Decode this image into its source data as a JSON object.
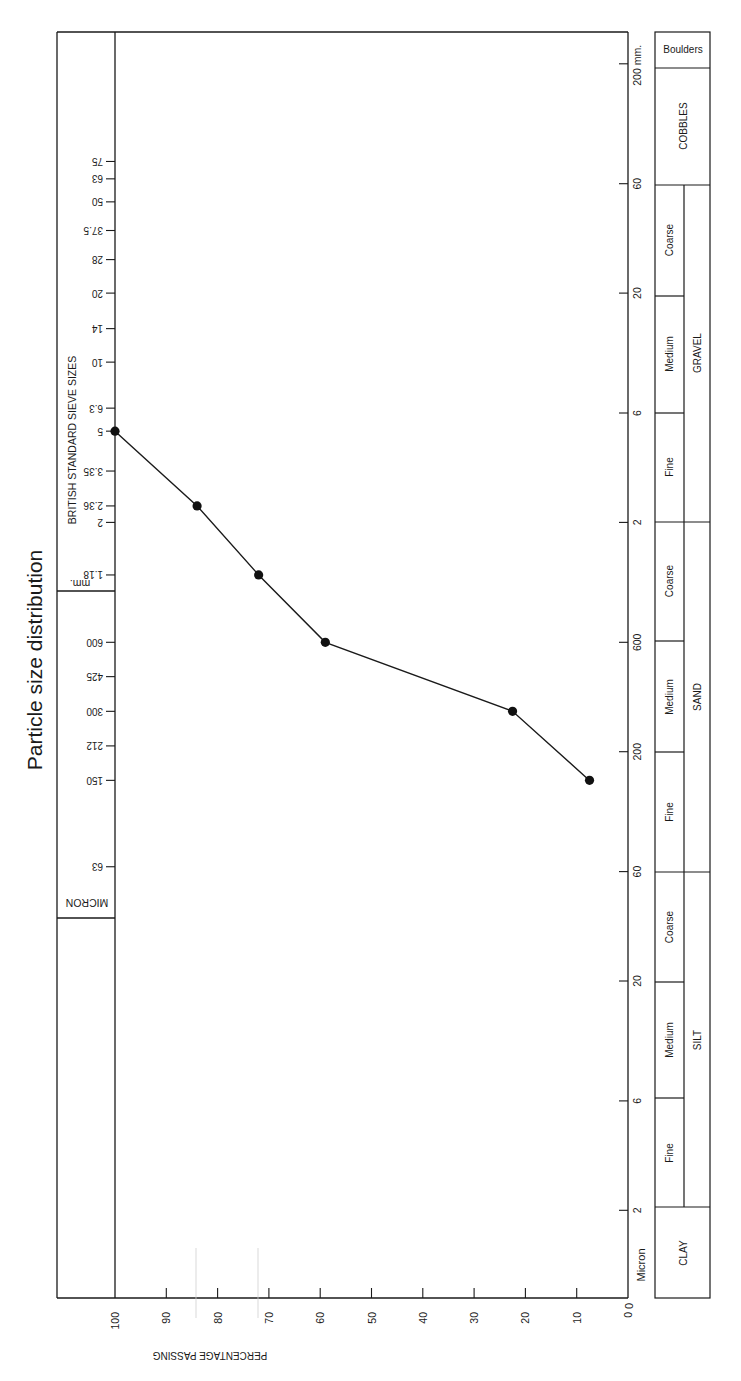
{
  "chart_data": {
    "type": "line",
    "title": "Particle size distribution",
    "orientation": "rotated 90deg clockwise (percentage axis horizontal at bottom, size axis vertical)",
    "xlabel": "PERCENTAGE PASSING",
    "ylabel": "BRITISH STANDARD SIEVE SIZES",
    "percentage_axis": {
      "ticks": [
        100,
        90,
        80,
        70,
        60,
        50,
        40,
        30,
        20,
        10,
        0
      ],
      "range": [
        0,
        100
      ]
    },
    "sieve_axis": {
      "mm_label": "mm.",
      "micron_label": "MICRON",
      "mm_sizes": [
        "75",
        "63",
        "50",
        "37.5",
        "28",
        "20",
        "14",
        "10",
        "6.3",
        "5",
        "3.35",
        "2.36",
        "2",
        "1.18"
      ],
      "micron_sizes": [
        "600",
        "425",
        "300",
        "212",
        "150",
        "63"
      ]
    },
    "size_scale": {
      "ticks": [
        "200 mm.",
        "60",
        "20",
        "6",
        "2",
        "600",
        "200",
        "60",
        "20",
        "6",
        "2"
      ],
      "unit_label_bottom": "Micron",
      "zero_label": "0"
    },
    "classification": {
      "top": "Boulders",
      "cobbles": "COBBLES",
      "groups": [
        {
          "name": "GRAVEL",
          "subs": [
            "Coarse",
            "Medium",
            "Fine"
          ]
        },
        {
          "name": "SAND",
          "subs": [
            "Coarse",
            "Medium",
            "Fine"
          ]
        },
        {
          "name": "SILT",
          "subs": [
            "Coarse",
            "Medium",
            "Fine"
          ]
        }
      ],
      "bottom": "CLAY"
    },
    "series": [
      {
        "name": "Sample grading",
        "x_label": "sieve size",
        "x": [
          "5 mm",
          "2.36 mm",
          "1.18 mm",
          "600 µm",
          "300 µm",
          "150 µm"
        ],
        "values": [
          100,
          84,
          72,
          59,
          22.5,
          7.5
        ]
      }
    ],
    "grid": false,
    "legend": "none"
  }
}
